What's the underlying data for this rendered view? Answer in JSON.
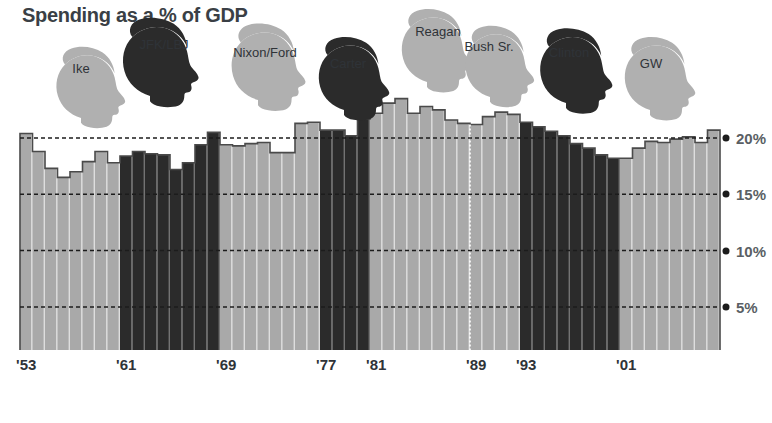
{
  "title": "Spending as a % of GDP",
  "colors": {
    "bar_light": "#a9a9a9",
    "bar_dark": "#2b2b2b",
    "bar_outline": "#4a4a4a",
    "silhouette_light": "#b0b0b0",
    "silhouette_dark": "#2b2b2b",
    "gridline": "#1c1c1c",
    "text": "#2f3338",
    "title_text": "#3a3f45",
    "axis_text": "#5a5f64",
    "background": "#ffffff"
  },
  "chart_data": {
    "type": "bar",
    "title": "Spending as a % of GDP",
    "xlabel": "",
    "ylabel": "",
    "ylim": [
      0,
      25
    ],
    "grid": true,
    "gridlines": [
      5,
      10,
      15,
      20
    ],
    "ytick_labels": [
      "20%",
      "15%",
      "10%",
      "5%"
    ],
    "ytick_values": [
      20,
      15,
      10,
      5
    ],
    "xtick_labels": [
      "'53",
      "'61",
      "'69",
      "'77",
      "'81",
      "'89",
      "'93",
      "'01"
    ],
    "xtick_years": [
      1953,
      1961,
      1969,
      1977,
      1981,
      1989,
      1993,
      2001
    ],
    "x_start_year": 1953,
    "x_end_year": 2008,
    "legend": [],
    "series": [
      {
        "name": "Federal spending as % of GDP",
        "years": [
          1953,
          1954,
          1955,
          1956,
          1957,
          1958,
          1959,
          1960,
          1961,
          1962,
          1963,
          1964,
          1965,
          1966,
          1967,
          1968,
          1969,
          1970,
          1971,
          1972,
          1973,
          1974,
          1975,
          1976,
          1977,
          1978,
          1979,
          1980,
          1981,
          1982,
          1983,
          1984,
          1985,
          1986,
          1987,
          1988,
          1989,
          1990,
          1991,
          1992,
          1993,
          1994,
          1995,
          1996,
          1997,
          1998,
          1999,
          2000,
          2001,
          2002,
          2003,
          2004,
          2005,
          2006,
          2007,
          2008
        ],
        "values": [
          20.4,
          18.8,
          17.3,
          16.5,
          17.0,
          17.9,
          18.8,
          17.8,
          18.4,
          18.8,
          18.6,
          18.5,
          17.2,
          17.8,
          19.4,
          20.5,
          19.4,
          19.3,
          19.5,
          19.6,
          18.7,
          18.7,
          21.3,
          21.4,
          20.7,
          20.7,
          20.2,
          21.7,
          22.2,
          23.1,
          23.5,
          22.2,
          22.8,
          22.5,
          21.6,
          21.3,
          21.2,
          21.9,
          22.3,
          22.1,
          21.4,
          21.0,
          20.6,
          20.2,
          19.5,
          19.1,
          18.5,
          18.2,
          18.2,
          19.1,
          19.7,
          19.6,
          19.9,
          20.1,
          19.6,
          20.7
        ]
      }
    ],
    "party_colors": {
      "republican": "#a9a9a9",
      "democrat": "#2b2b2b"
    }
  },
  "presidents": [
    {
      "name": "Ike",
      "start": 1953,
      "end": 1960,
      "party": "republican",
      "label_x": 81,
      "label_y": 61,
      "sil_cx": 81,
      "sil_cy": 118,
      "sil_scale": 0.8,
      "sil_flip": false
    },
    {
      "name": "JFK/LBJ",
      "start": 1961,
      "end": 1968,
      "party": "democrat",
      "label_x": 164,
      "label_y": 37,
      "sil_cx": 150,
      "sil_cy": 96,
      "sil_scale": 0.88,
      "sil_flip": false
    },
    {
      "name": "Nixon/Ford",
      "start": 1969,
      "end": 1976,
      "party": "republican",
      "label_x": 265,
      "label_y": 45,
      "sil_cx": 258,
      "sil_cy": 100,
      "sil_scale": 0.86,
      "sil_flip": false
    },
    {
      "name": "Carter",
      "start": 1977,
      "end": 1980,
      "party": "democrat",
      "label_x": 348,
      "label_y": 56,
      "sil_cx": 344,
      "sil_cy": 110,
      "sil_scale": 0.82,
      "sil_flip": false
    },
    {
      "name": "Reagan",
      "start": 1981,
      "end": 1988,
      "party": "republican",
      "label_x": 438,
      "label_y": 24,
      "sil_cx": 427,
      "sil_cy": 82,
      "sil_scale": 0.82,
      "sil_flip": false
    },
    {
      "name": "Bush Sr.",
      "start": 1989,
      "end": 1992,
      "party": "republican",
      "label_x": 489,
      "label_y": 39,
      "sil_cx": 490,
      "sil_cy": 97,
      "sil_scale": 0.8,
      "sil_flip": false
    },
    {
      "name": "Clinton",
      "start": 1993,
      "end": 2000,
      "party": "democrat",
      "label_x": 569,
      "label_y": 45,
      "sil_cx": 566,
      "sil_cy": 103,
      "sil_scale": 0.84,
      "sil_flip": false
    },
    {
      "name": "GW",
      "start": 2001,
      "end": 2008,
      "party": "republican",
      "label_x": 651,
      "label_y": 56,
      "sil_cx": 650,
      "sil_cy": 110,
      "sil_scale": 0.82,
      "sil_flip": false
    }
  ],
  "geometry": {
    "plot_left": 20,
    "plot_right": 720,
    "baseline_y": 350,
    "px_per_year": 12.5,
    "y_at_20pct": 138,
    "px_per_5pct": 56.3
  },
  "extra_separator_year": 1989
}
